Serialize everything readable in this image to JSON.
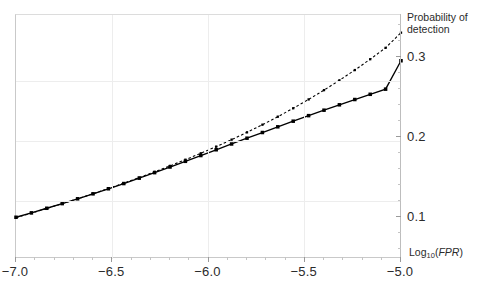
{
  "chart_data": {
    "type": "line",
    "title": "",
    "xlabel": "Log10(FPR)",
    "ylabel": "Probability of detection",
    "xlim": [
      -7.0,
      -5.0
    ],
    "ylim": [
      0.048,
      0.352
    ],
    "grid": true,
    "legend": "none",
    "xticks": [
      -7.0,
      -6.5,
      -6.0,
      -5.5,
      -5.0
    ],
    "xticklabels": [
      "-7.0",
      "-6.5",
      "-6.0",
      "-5.5",
      "-5.0"
    ],
    "yticks": [
      0.1,
      0.2,
      0.3
    ],
    "yticklabels": [
      "0.1",
      "0.2",
      "0.3"
    ],
    "series": [
      {
        "name": "solid-curve-square-markers",
        "style": "solid",
        "marker": "square",
        "color": "#000000",
        "x": [
          -7.0,
          -6.92,
          -6.84,
          -6.76,
          -6.68,
          -6.6,
          -6.52,
          -6.44,
          -6.36,
          -6.28,
          -6.2,
          -6.12,
          -6.04,
          -5.96,
          -5.88,
          -5.8,
          -5.72,
          -5.64,
          -5.56,
          -5.48,
          -5.4,
          -5.32,
          -5.24,
          -5.16,
          -5.08,
          -5.0
        ],
        "y": [
          0.1,
          0.1055,
          0.1112,
          0.117,
          0.123,
          0.1292,
          0.1355,
          0.142,
          0.1487,
          0.1556,
          0.1626,
          0.1697,
          0.1769,
          0.1841,
          0.1913,
          0.1985,
          0.2056,
          0.2127,
          0.2197,
          0.2266,
          0.2334,
          0.2401,
          0.2467,
          0.2532,
          0.2596,
          0.295
        ]
      },
      {
        "name": "dotted-curve-diverging",
        "style": "dotted",
        "marker": "small-square",
        "color": "#000000",
        "x": [
          -7.0,
          -6.92,
          -6.84,
          -6.76,
          -6.68,
          -6.6,
          -6.52,
          -6.44,
          -6.36,
          -6.28,
          -6.2,
          -6.12,
          -6.04,
          -5.96,
          -5.88,
          -5.8,
          -5.72,
          -5.64,
          -5.56,
          -5.48,
          -5.4,
          -5.32,
          -5.24,
          -5.16,
          -5.08,
          -5.0
        ],
        "y": [
          0.0995,
          0.1052,
          0.111,
          0.1169,
          0.123,
          0.1293,
          0.1358,
          0.1425,
          0.1494,
          0.1566,
          0.164,
          0.1717,
          0.1797,
          0.188,
          0.1967,
          0.2058,
          0.2153,
          0.2253,
          0.2358,
          0.2468,
          0.2584,
          0.2706,
          0.2834,
          0.2969,
          0.3111,
          0.33
        ]
      }
    ]
  },
  "axes": {
    "y_title_line1": "Probability of",
    "y_title_line2": "detection",
    "x_title_main": "Log",
    "x_title_sub": "10",
    "x_title_paren_open": "(",
    "x_title_var": "FPR",
    "x_title_paren_close": ")"
  }
}
